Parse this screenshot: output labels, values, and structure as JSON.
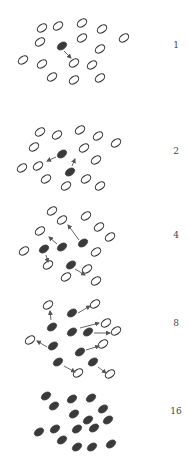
{
  "colors": {
    "background": "#ffffff",
    "filled": "#3a3a3a",
    "outline": "#333333",
    "arrow": "#555555",
    "label": "#444444"
  },
  "ellipse": {
    "rx": 5.2,
    "ry": 3.4,
    "angle": -35
  },
  "panels": [
    {
      "label": "1",
      "label_y": 40,
      "open": [
        [
          42,
          28
        ],
        [
          58,
          26
        ],
        [
          82,
          23
        ],
        [
          102,
          29
        ],
        [
          40,
          42
        ],
        [
          82,
          38
        ],
        [
          124,
          38
        ],
        [
          100,
          49
        ],
        [
          23,
          60
        ],
        [
          42,
          64
        ],
        [
          74,
          63
        ],
        [
          92,
          65
        ],
        [
          52,
          77
        ],
        [
          74,
          80
        ],
        [
          100,
          78
        ]
      ],
      "filled": [
        [
          62,
          46
        ]
      ],
      "arrows": [
        [
          [
            64,
            51
          ],
          [
            71,
            58
          ]
        ]
      ]
    },
    {
      "label": "2",
      "label_y": 146,
      "open": [
        [
          40,
          132
        ],
        [
          57,
          135
        ],
        [
          80,
          130
        ],
        [
          98,
          136
        ],
        [
          34,
          147
        ],
        [
          84,
          148
        ],
        [
          116,
          143
        ],
        [
          96,
          160
        ],
        [
          22,
          168
        ],
        [
          38,
          166
        ],
        [
          46,
          179
        ],
        [
          66,
          186
        ],
        [
          86,
          179
        ],
        [
          100,
          186
        ]
      ],
      "filled": [
        [
          62,
          154
        ],
        [
          70,
          172
        ]
      ],
      "arrows": [
        [
          [
            56,
            157
          ],
          [
            47,
            161
          ]
        ],
        [
          [
            72,
            166
          ],
          [
            75,
            159
          ]
        ]
      ]
    },
    {
      "label": "4",
      "label_y": 230,
      "open": [
        [
          52,
          211
        ],
        [
          62,
          220
        ],
        [
          86,
          216
        ],
        [
          99,
          227
        ],
        [
          40,
          231
        ],
        [
          110,
          237
        ],
        [
          24,
          251
        ],
        [
          96,
          252
        ],
        [
          48,
          265
        ],
        [
          66,
          277
        ],
        [
          87,
          269
        ],
        [
          96,
          281
        ]
      ],
      "filled": [
        [
          62,
          247
        ],
        [
          83,
          243
        ],
        [
          44,
          249
        ],
        [
          71,
          265
        ]
      ],
      "arrows": [
        [
          [
            57,
            244
          ],
          [
            49,
            237
          ]
        ],
        [
          [
            79,
            240
          ],
          [
            68,
            225
          ]
        ],
        [
          [
            46,
            255
          ],
          [
            48,
            262
          ]
        ],
        [
          [
            75,
            269
          ],
          [
            85,
            275
          ]
        ]
      ]
    },
    {
      "label": "8",
      "label_y": 318,
      "open": [
        [
          48,
          305
        ],
        [
          95,
          304
        ],
        [
          106,
          323
        ],
        [
          116,
          331
        ],
        [
          30,
          340
        ],
        [
          103,
          344
        ],
        [
          78,
          373
        ],
        [
          110,
          374
        ]
      ],
      "filled": [
        [
          72,
          313
        ],
        [
          52,
          327
        ],
        [
          72,
          332
        ],
        [
          88,
          332
        ],
        [
          53,
          346
        ],
        [
          80,
          352
        ],
        [
          58,
          362
        ],
        [
          93,
          362
        ]
      ],
      "arrows": [
        [
          [
            78,
            313
          ],
          [
            90,
            306
          ]
        ],
        [
          [
            51,
            320
          ],
          [
            50,
            311
          ]
        ],
        [
          [
            80,
            328
          ],
          [
            99,
            323
          ]
        ],
        [
          [
            94,
            333
          ],
          [
            110,
            333
          ]
        ],
        [
          [
            47,
            347
          ],
          [
            37,
            341
          ]
        ],
        [
          [
            86,
            350
          ],
          [
            99,
            346
          ]
        ],
        [
          [
            64,
            366
          ],
          [
            75,
            372
          ]
        ],
        [
          [
            98,
            367
          ],
          [
            106,
            373
          ]
        ]
      ]
    },
    {
      "label": "16",
      "label_y": 406,
      "open": [],
      "filled": [
        [
          46,
          396
        ],
        [
          54,
          406
        ],
        [
          72,
          399
        ],
        [
          91,
          398
        ],
        [
          103,
          409
        ],
        [
          74,
          414
        ],
        [
          88,
          420
        ],
        [
          108,
          420
        ],
        [
          39,
          432
        ],
        [
          55,
          429
        ],
        [
          77,
          429
        ],
        [
          94,
          428
        ],
        [
          62,
          440
        ],
        [
          77,
          447
        ],
        [
          92,
          447
        ],
        [
          111,
          444
        ]
      ],
      "arrows": []
    }
  ]
}
